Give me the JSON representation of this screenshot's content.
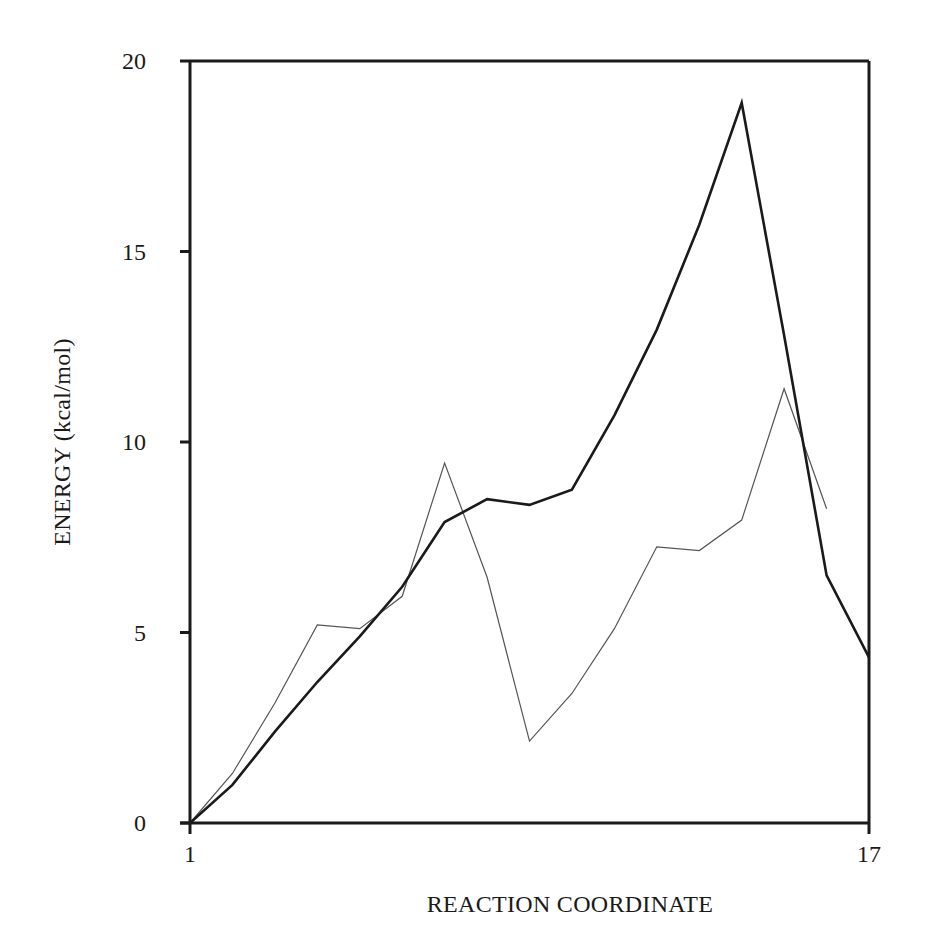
{
  "chart_data": {
    "type": "line",
    "title": "",
    "xlabel": "REACTION COORDINATE",
    "ylabel": "ENERGY (kcal/mol)",
    "xlim": [
      1,
      17
    ],
    "ylim": [
      0,
      20
    ],
    "x_ticks": [
      1,
      17
    ],
    "x_tick_labels": [
      "1",
      "17"
    ],
    "y_ticks": [
      0,
      5,
      10,
      15,
      20
    ],
    "y_tick_labels": [
      "0",
      "5",
      "10",
      "15",
      "20"
    ],
    "grid": false,
    "legend": null,
    "x": [
      1,
      2,
      3,
      4,
      5,
      6,
      7,
      8,
      9,
      10,
      11,
      12,
      13,
      14,
      15,
      16,
      17
    ],
    "series": [
      {
        "name": "dark (thick) curve",
        "color": "#1a1a1a",
        "stroke_width": 2.6,
        "values": [
          0,
          1.0,
          2.4,
          3.7,
          4.9,
          6.2,
          7.9,
          8.5,
          8.35,
          8.75,
          10.7,
          12.95,
          15.7,
          18.9,
          12.8,
          6.5,
          4.35
        ]
      },
      {
        "name": "light (thin) curve",
        "color": "#555555",
        "stroke_width": 1.2,
        "values": [
          0,
          1.3,
          3.15,
          5.2,
          5.1,
          5.95,
          9.45,
          6.45,
          2.15,
          3.4,
          5.1,
          7.25,
          7.15,
          7.95,
          11.4,
          8.25,
          null
        ]
      }
    ]
  },
  "labels": {
    "y_axis_title": "ENERGY (kcal/mol)",
    "x_axis_title": "REACTION COORDINATE",
    "y_ticks": [
      "0",
      "5",
      "10",
      "15",
      "20"
    ],
    "x_ticks": [
      "1",
      "17"
    ]
  }
}
